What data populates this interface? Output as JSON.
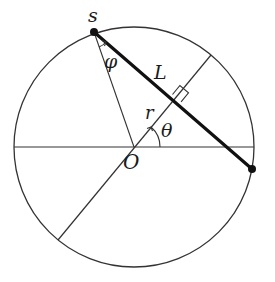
{
  "figure": {
    "type": "geometry-diagram"
  },
  "labels": {
    "s": "s",
    "phi": "φ",
    "L": "L",
    "r": "r",
    "theta": "θ",
    "O": "O"
  },
  "colors": {
    "stroke": "#333333",
    "chord": "#111111",
    "background": "#ffffff"
  },
  "geometry": {
    "center": [
      134,
      147
    ],
    "radius": 120,
    "point_s": [
      94,
      32
    ],
    "chord_end": [
      252,
      169
    ],
    "perpendicular_foot": [
      178,
      100
    ],
    "tilted_diameter": [
      [
        211,
        55
      ],
      [
        58,
        240
      ]
    ],
    "horizontal_diameter": [
      [
        14,
        147
      ],
      [
        254,
        147
      ]
    ]
  }
}
